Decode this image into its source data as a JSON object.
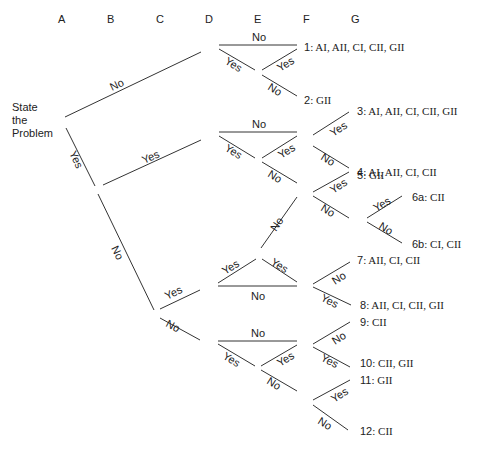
{
  "diagram": {
    "type": "decision-tree",
    "columns": [
      "A",
      "B",
      "C",
      "D",
      "E",
      "F",
      "G"
    ],
    "root": [
      "State",
      "the",
      "Problem"
    ],
    "branch_labels": {
      "yes": "Yes",
      "no": "No"
    },
    "outcomes": [
      {
        "id": "1",
        "text": "AI, AII, CI, CII, GII"
      },
      {
        "id": "2",
        "text": "GII"
      },
      {
        "id": "3",
        "text": "AI, AII, CI, CII, GII"
      },
      {
        "id": "4",
        "text": "AI, AII, CI, CII"
      },
      {
        "id": "5",
        "text": "GII"
      },
      {
        "id": "6a",
        "text": "CII"
      },
      {
        "id": "6b",
        "text": "CI, CII"
      },
      {
        "id": "7",
        "text": "AII, CI, CII"
      },
      {
        "id": "8",
        "text": "AII, CI, CII, GII"
      },
      {
        "id": "9",
        "text": "CII"
      },
      {
        "id": "10",
        "text": "CII, GII"
      },
      {
        "id": "11",
        "text": "GII"
      },
      {
        "id": "12",
        "text": "CII"
      }
    ]
  }
}
